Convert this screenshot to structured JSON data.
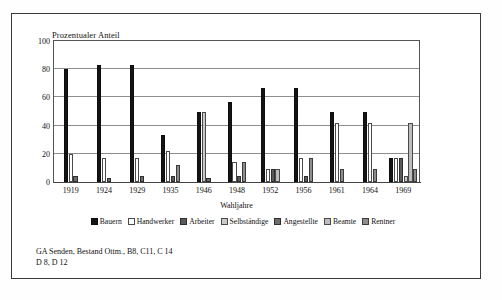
{
  "figure": {
    "caption_lines": [
      "GA Senden, Bestand Ottm., B8, C11, C 14",
      "D 8, D 12"
    ]
  },
  "chart_data": {
    "type": "bar",
    "title": "",
    "ylabel": "Prozentualer Anteil",
    "xlabel": "Wahljahre",
    "ylim": [
      0,
      100
    ],
    "yticks": [
      "0",
      "20",
      "40",
      "60",
      "80",
      "100"
    ],
    "gridlines": [
      20,
      40,
      60,
      80
    ],
    "grid": true,
    "legend_position": "bottom",
    "categories": [
      "1919",
      "1924",
      "1929",
      "1935",
      "1946",
      "1948",
      "1952",
      "1956",
      "1961",
      "1964",
      "1969"
    ],
    "series": [
      {
        "name": "Bauern",
        "color": "#141414",
        "values": [
          80,
          83,
          83,
          33,
          50,
          57,
          67,
          67,
          50,
          50,
          17
        ]
      },
      {
        "name": "Handwerker",
        "color": "#ffffff",
        "values": [
          20,
          17,
          17,
          22,
          0,
          14,
          9,
          17,
          42,
          42,
          17
        ]
      },
      {
        "name": "Arbeiter",
        "color": "#5a5a5a",
        "values": [
          0,
          0,
          0,
          4,
          0,
          4,
          9,
          4,
          0,
          0,
          17
        ]
      },
      {
        "name": "Selbständige",
        "color": "#c9c9c9",
        "values": [
          0,
          0,
          0,
          0,
          50,
          0,
          0,
          0,
          0,
          0,
          4
        ]
      },
      {
        "name": "Angestellte",
        "color": "#6e6e6e",
        "values": [
          4,
          3,
          4,
          0,
          3,
          0,
          0,
          0,
          0,
          0,
          0
        ]
      },
      {
        "name": "Beamte",
        "color": "#bdbdbd",
        "values": [
          0,
          0,
          0,
          0,
          0,
          0,
          9,
          0,
          0,
          0,
          42
        ]
      },
      {
        "name": "Rentner",
        "color": "#8d8d8d",
        "values": [
          0,
          0,
          0,
          12,
          0,
          14,
          0,
          17,
          9,
          9,
          9
        ]
      }
    ]
  }
}
